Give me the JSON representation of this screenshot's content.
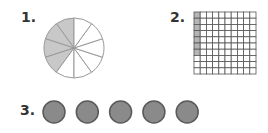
{
  "problems": [
    {
      "number": "1.",
      "type": "fraction-circle",
      "sectors": 10,
      "shaded": 4
    },
    {
      "number": "2.",
      "type": "hundred-grid",
      "rows": 10,
      "cols": 10,
      "shaded_cells": 7
    },
    {
      "number": "3.",
      "type": "coins",
      "count": 5
    }
  ],
  "colors": {
    "shade": "#c8c8c8",
    "line": "#999999",
    "grid_line": "#555555",
    "coin_fill": "#8a8a8a",
    "coin_stroke": "#5a5a5a"
  }
}
